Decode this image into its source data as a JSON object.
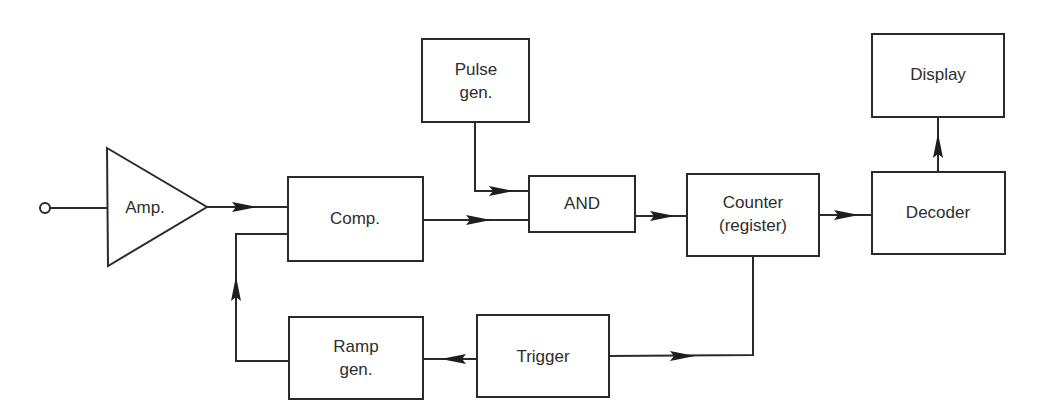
{
  "diagram": {
    "type": "block-diagram",
    "colors": {
      "stroke": "#2a2a2a",
      "text": "#2e2e2e",
      "background": "#ffffff"
    },
    "blocks": {
      "amp": {
        "label": "Amp.",
        "shape": "triangle"
      },
      "comp": {
        "label": "Comp."
      },
      "pulse_gen": {
        "line1": "Pulse",
        "line2": "gen."
      },
      "and_gate": {
        "label": "AND"
      },
      "counter": {
        "line1": "Counter",
        "line2": "(register)"
      },
      "decoder": {
        "label": "Decoder"
      },
      "display": {
        "label": "Display"
      },
      "ramp_gen": {
        "line1": "Ramp",
        "line2": "gen."
      },
      "trigger": {
        "label": "Trigger"
      }
    },
    "connections": [
      {
        "from": "input-terminal",
        "to": "amp"
      },
      {
        "from": "amp",
        "to": "comp"
      },
      {
        "from": "comp",
        "to": "and_gate"
      },
      {
        "from": "pulse_gen",
        "to": "and_gate"
      },
      {
        "from": "and_gate",
        "to": "counter"
      },
      {
        "from": "counter",
        "to": "decoder"
      },
      {
        "from": "decoder",
        "to": "display"
      },
      {
        "from": "counter",
        "to": "trigger"
      },
      {
        "from": "trigger",
        "to": "ramp_gen"
      },
      {
        "from": "ramp_gen",
        "to": "comp"
      }
    ]
  }
}
